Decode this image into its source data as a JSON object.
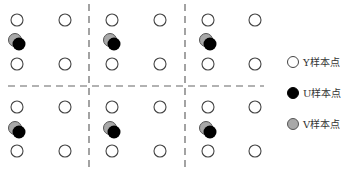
{
  "diagram": {
    "type": "chroma-subsampling-sample-grid",
    "grid": {
      "columns_x": [
        17,
        65,
        112,
        160,
        208,
        255
      ],
      "rows_y": [
        20,
        64,
        107,
        151
      ],
      "y_sample_radius": 6,
      "chroma_pairs_per_block": [
        {
          "x": 17,
          "y": 42
        },
        {
          "x": 112,
          "y": 42
        },
        {
          "x": 208,
          "y": 42
        },
        {
          "x": 17,
          "y": 130
        },
        {
          "x": 112,
          "y": 130
        },
        {
          "x": 208,
          "y": 130
        }
      ],
      "vertical_dividers_x": [
        89,
        185
      ],
      "horizontal_divider_y": 86
    },
    "colors": {
      "y_sample_fill": "#ffffff",
      "y_sample_stroke": "#444444",
      "u_sample_fill": "#000000",
      "v_sample_fill": "#a8a8a8",
      "divider": "#666666"
    }
  },
  "legend": {
    "items": [
      {
        "key": "y",
        "label": "Y样本点"
      },
      {
        "key": "u",
        "label": "U样本点"
      },
      {
        "key": "v",
        "label": "V样本点"
      }
    ]
  }
}
